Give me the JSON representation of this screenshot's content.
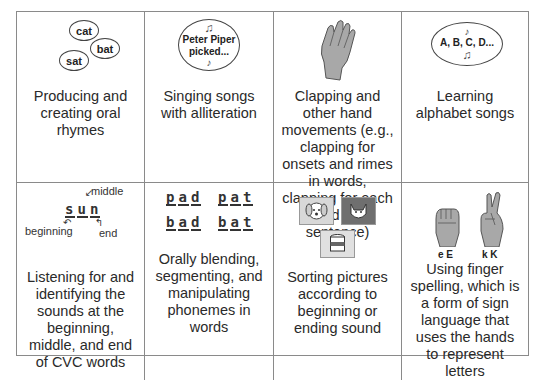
{
  "cells": [
    {
      "caption": "Producing and creating oral rhymes",
      "illustration": {
        "type": "speech-bubbles",
        "words": [
          "cat",
          "bat",
          "sat"
        ]
      }
    },
    {
      "caption": "Singing songs with alliteration",
      "illustration": {
        "type": "speech-bubble-song",
        "text_line1": "Peter Piper",
        "text_line2": "picked..."
      }
    },
    {
      "caption": "Clapping and other hand movements (e.g., clapping for onsets and rimes in words, clapping for each word in a sentence)",
      "illustration": {
        "type": "clapping-hand-icon"
      }
    },
    {
      "caption": "Learning alphabet songs",
      "illustration": {
        "type": "speech-bubble-song",
        "text": "A, B, C, D..."
      }
    },
    {
      "caption": "Listening for and identifying the sounds at the beginning, middle, and end of CVC words",
      "illustration": {
        "type": "cvc-diagram",
        "letters": [
          "s",
          "u",
          "n"
        ],
        "labels": {
          "beginning": "beginning",
          "middle": "middle",
          "end": "end"
        }
      }
    },
    {
      "caption": "Orally blending, segmenting, and manipulating phonemes in words",
      "illustration": {
        "type": "phoneme-words",
        "words": [
          [
            "p",
            "a",
            "d"
          ],
          [
            "p",
            "a",
            "t"
          ],
          [
            "b",
            "a",
            "d"
          ],
          [
            "b",
            "a",
            "t"
          ]
        ]
      }
    },
    {
      "caption": "Sorting pictures according to beginning or ending sound",
      "illustration": {
        "type": "picture-cards",
        "pictures": [
          "dog",
          "cat",
          "can"
        ]
      }
    },
    {
      "caption": "Using finger spelling, which is a form of sign language that uses the hands to represent letters",
      "illustration": {
        "type": "finger-spelling",
        "letters": [
          "e E",
          "k K"
        ]
      }
    }
  ],
  "colors": {
    "border": "#8a8a8a",
    "hand": "#a8a8a8",
    "text": "#2a2a2a"
  }
}
